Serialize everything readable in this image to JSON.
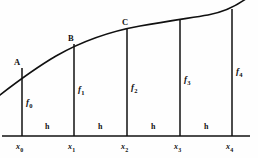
{
  "figure": {
    "background_color": "#fefefe",
    "ink_color": "#101010",
    "curve": {
      "name": "function-curve",
      "description": "monotonically increasing concave curve y = f(x)",
      "stroke_color": "#101010",
      "stroke_width": 1.6,
      "path": "M -4,98 C 14,84 32,70 56,56 C 84,40 112,31 140,26 C 168,21 190,18 208,15 C 224,12 238,6 252,-6"
    },
    "axis": {
      "name": "x-axis",
      "stroke_color": "#101010",
      "stroke_width": 1.7,
      "x_start": 2,
      "x_end": 250,
      "y": 136
    },
    "ordinates": [
      {
        "id": "ordinate-0",
        "x": 22,
        "y_top": 68,
        "y_bottom": 136
      },
      {
        "id": "ordinate-1",
        "x": 74,
        "y_top": 44,
        "y_bottom": 136
      },
      {
        "id": "ordinate-2",
        "x": 127,
        "y_top": 29,
        "y_bottom": 136
      },
      {
        "id": "ordinate-3",
        "x": 180,
        "y_top": 20,
        "y_bottom": 136
      },
      {
        "id": "ordinate-4",
        "x": 232,
        "y_top": 9,
        "y_bottom": 136
      }
    ],
    "point_labels": [
      {
        "id": "point-a",
        "text": "A",
        "x": 14,
        "y": 58
      },
      {
        "id": "point-b",
        "text": "B",
        "x": 68,
        "y": 34
      },
      {
        "id": "point-c",
        "text": "C",
        "x": 122,
        "y": 18
      }
    ],
    "ordinate_labels": [
      {
        "id": "f-label-0",
        "symbol": "f",
        "subscript": "0",
        "x": 26,
        "y": 98
      },
      {
        "id": "f-label-1",
        "symbol": "f",
        "subscript": "1",
        "x": 78,
        "y": 85
      },
      {
        "id": "f-label-2",
        "symbol": "f",
        "subscript": "2",
        "x": 131,
        "y": 83
      },
      {
        "id": "f-label-3",
        "symbol": "f",
        "subscript": "3",
        "x": 184,
        "y": 75
      },
      {
        "id": "f-label-4",
        "symbol": "f",
        "subscript": "4",
        "x": 236,
        "y": 67
      }
    ],
    "axis_labels": [
      {
        "id": "x-label-0",
        "symbol": "x",
        "subscript": "0",
        "x": 16,
        "y": 143
      },
      {
        "id": "x-label-1",
        "symbol": "x",
        "subscript": "1",
        "x": 68,
        "y": 143
      },
      {
        "id": "x-label-2",
        "symbol": "x",
        "subscript": "2",
        "x": 121,
        "y": 143
      },
      {
        "id": "x-label-3",
        "symbol": "x",
        "subscript": "3",
        "x": 174,
        "y": 143
      },
      {
        "id": "x-label-4",
        "symbol": "x",
        "subscript": "4",
        "x": 226,
        "y": 143
      }
    ],
    "width_labels": [
      {
        "id": "h-label-0",
        "text": "h",
        "x": 45,
        "y": 123
      },
      {
        "id": "h-label-1",
        "text": "h",
        "x": 98,
        "y": 123
      },
      {
        "id": "h-label-2",
        "text": "h",
        "x": 151,
        "y": 123
      },
      {
        "id": "h-label-3",
        "text": "h",
        "x": 204,
        "y": 123
      }
    ]
  }
}
